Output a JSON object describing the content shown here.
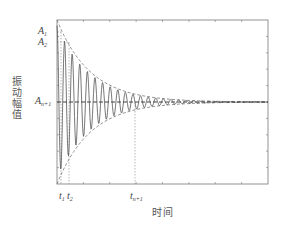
{
  "chart_data": {
    "type": "line",
    "title": "",
    "xlabel": "时间",
    "ylabel": "振动幅值",
    "grid": false,
    "legend": null,
    "y_tick_labels": [
      {
        "name": "A1",
        "base": "A",
        "sub": "1"
      },
      {
        "name": "A2",
        "base": "A",
        "sub": "2"
      },
      {
        "name": "An+1",
        "base": "A",
        "sub": "n+1"
      }
    ],
    "x_tick_labels": [
      {
        "name": "t1",
        "base": "t",
        "sub": "1"
      },
      {
        "name": "t2",
        "base": "t",
        "sub": "2"
      },
      {
        "name": "tn+1",
        "base": "t",
        "sub": "n+1"
      }
    ],
    "series": [
      {
        "name": "oscillation",
        "style": "solid",
        "color": "#555555"
      },
      {
        "name": "upper-envelope",
        "style": "dashed",
        "color": "#777777"
      },
      {
        "name": "lower-envelope",
        "style": "dashed",
        "color": "#777777"
      },
      {
        "name": "steady-state",
        "style": "dashed",
        "color": "#444444"
      }
    ],
    "plot_px": {
      "left": 57,
      "top": 20,
      "right": 268,
      "bottom": 184
    },
    "steady_y_px": 102,
    "A1_y_px": 32,
    "A2_y_px": 42,
    "t1_x_px": 61,
    "t2_x_px": 69,
    "tn1_x_px": 135,
    "decay_rate": 0.03,
    "period_px": 7.6,
    "cycles": 27
  },
  "labels": {
    "A1": {
      "base": "A",
      "sub": "1"
    },
    "A2": {
      "base": "A",
      "sub": "2"
    },
    "An1": {
      "base": "A",
      "sub": "n+1"
    },
    "t1": {
      "base": "t",
      "sub": "1"
    },
    "t2": {
      "base": "t",
      "sub": "2"
    },
    "tn1": {
      "base": "t",
      "sub": "n+1"
    },
    "xlabel": "时间",
    "ylabel": "振动幅值"
  }
}
